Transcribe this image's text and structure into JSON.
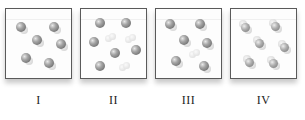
{
  "figure": {
    "type": "particle-diagram",
    "colors": {
      "border": "#5a5a5a",
      "atom_dark": "#8a8a8a",
      "atom_light": "#dcdcdc",
      "label_text": "#222222"
    },
    "panels": [
      {
        "label": "I",
        "left": 5,
        "molecules": [
          {
            "kind": "diatomic",
            "x": 15,
            "y": 18
          },
          {
            "kind": "diatomic",
            "x": 48,
            "y": 18
          },
          {
            "kind": "diatomic",
            "x": 31,
            "y": 31
          },
          {
            "kind": "diatomic",
            "x": 55,
            "y": 35
          },
          {
            "kind": "diatomic",
            "x": 20,
            "y": 49
          },
          {
            "kind": "diatomic",
            "x": 43,
            "y": 54
          }
        ]
      },
      {
        "label": "II",
        "left": 80,
        "molecules": [
          {
            "kind": "atom",
            "x": 19,
            "y": 14
          },
          {
            "kind": "atom",
            "x": 45,
            "y": 14
          },
          {
            "kind": "pale-diatomic",
            "x": 29,
            "y": 28
          },
          {
            "kind": "pale-diatomic",
            "x": 49,
            "y": 29
          },
          {
            "kind": "atom",
            "x": 13,
            "y": 33
          },
          {
            "kind": "atom",
            "x": 34,
            "y": 44
          },
          {
            "kind": "atom",
            "x": 55,
            "y": 41
          },
          {
            "kind": "atom",
            "x": 19,
            "y": 57
          },
          {
            "kind": "pale-diatomic",
            "x": 43,
            "y": 57
          }
        ]
      },
      {
        "label": "III",
        "left": 155,
        "molecules": [
          {
            "kind": "diatomic",
            "x": 14,
            "y": 15
          },
          {
            "kind": "diatomic",
            "x": 44,
            "y": 15
          },
          {
            "kind": "diatomic",
            "x": 28,
            "y": 31
          },
          {
            "kind": "diatomic",
            "x": 51,
            "y": 34
          },
          {
            "kind": "pale-diatomic",
            "x": 38,
            "y": 44
          },
          {
            "kind": "diatomic",
            "x": 20,
            "y": 52
          },
          {
            "kind": "diatomic",
            "x": 48,
            "y": 57
          }
        ]
      },
      {
        "label": "IV",
        "left": 230,
        "molecules": [
          {
            "kind": "triatomic",
            "x": 14,
            "y": 18
          },
          {
            "kind": "triatomic",
            "x": 44,
            "y": 17
          },
          {
            "kind": "triatomic",
            "x": 28,
            "y": 34
          },
          {
            "kind": "triatomic",
            "x": 53,
            "y": 38
          },
          {
            "kind": "triatomic",
            "x": 18,
            "y": 53
          },
          {
            "kind": "triatomic",
            "x": 42,
            "y": 54
          }
        ]
      }
    ]
  }
}
